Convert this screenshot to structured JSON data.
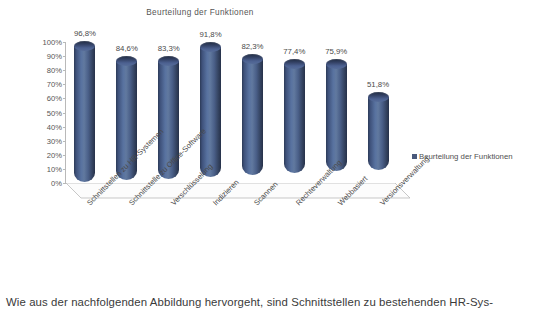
{
  "chart_data": {
    "type": "bar",
    "title": "Beurteilung der Funktionen",
    "xlabel": "",
    "ylabel": "",
    "ylim": [
      0,
      100
    ],
    "grid": false,
    "legend_position": "right",
    "style": "3d-cylinder",
    "categories": [
      "Schnittstellen zu HR-Systemen",
      "Schnittstelle zu Office-Software",
      "Verschlüsselung",
      "Indizieren",
      "Scannen",
      "Rechteverwaltung",
      "Webbasiert",
      "Versionsverwaltung"
    ],
    "values": [
      96.8,
      84.6,
      83.3,
      91.8,
      82.3,
      77.4,
      75.9,
      51.8
    ],
    "value_labels": [
      "96,8%",
      "84,6%",
      "83,3%",
      "91,8%",
      "82,3%",
      "77,4%",
      "75,9%",
      "51,8%"
    ],
    "ytick_labels": [
      "100%",
      "90%",
      "80%",
      "70%",
      "60%",
      "50%",
      "40%",
      "30%",
      "20%",
      "10%",
      "0%"
    ],
    "ytick_values": [
      100,
      90,
      80,
      70,
      60,
      50,
      40,
      30,
      20,
      10,
      0
    ],
    "series": [
      {
        "name": "Beurteilung der Funktionen",
        "values": [
          96.8,
          84.6,
          83.3,
          91.8,
          82.3,
          77.4,
          75.9,
          51.8
        ],
        "color": "#49597c"
      }
    ]
  },
  "legend": {
    "label": "Beurteilung der Funktionen",
    "swatch_color": "#49597c"
  },
  "document": {
    "paragraph": "Wie aus der nachfolgenden Abbildung hervorgeht, sind Schnittstellen zu bestehenden HR-Sys-"
  },
  "colors": {
    "bar_light": "#61799f",
    "bar_dark": "#263149",
    "axis": "#b9b9b9",
    "text": "#4a4a4a"
  }
}
